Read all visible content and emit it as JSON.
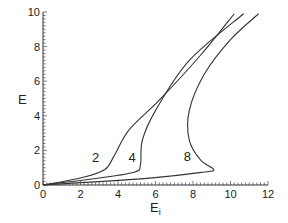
{
  "chart_data": {
    "type": "line",
    "title": "",
    "xlabel": "E",
    "xlabel_sub": "i",
    "ylabel": "E",
    "xlim": [
      0,
      12
    ],
    "ylim": [
      0,
      10
    ],
    "x_ticks": [
      "0",
      "2",
      "4",
      "6",
      "8",
      "10",
      "12"
    ],
    "y_ticks": [
      "0",
      "2",
      "4",
      "6",
      "8",
      "10"
    ],
    "grid": false,
    "legend": "none",
    "series": [
      {
        "name": "2",
        "points": [
          [
            0,
            0
          ],
          [
            2.0,
            0.4
          ],
          [
            3.3,
            0.9
          ],
          [
            3.8,
            1.7
          ],
          [
            4.6,
            3.2
          ],
          [
            6.2,
            4.9
          ],
          [
            8.4,
            7.5
          ],
          [
            10.2,
            9.9
          ]
        ]
      },
      {
        "name": "4",
        "points": [
          [
            0,
            0
          ],
          [
            3.0,
            0.4
          ],
          [
            4.9,
            0.75
          ],
          [
            5.2,
            1.2
          ],
          [
            5.3,
            2.6
          ],
          [
            6.0,
            4.3
          ],
          [
            7.8,
            7.2
          ],
          [
            10.7,
            9.9
          ]
        ]
      },
      {
        "name": "8",
        "points": [
          [
            0,
            0
          ],
          [
            5.7,
            0.4
          ],
          [
            8.6,
            0.75
          ],
          [
            9.1,
            0.9
          ],
          [
            8.4,
            1.45
          ],
          [
            7.8,
            2.6
          ],
          [
            7.8,
            4.3
          ],
          [
            8.6,
            6.4
          ],
          [
            10.0,
            8.4
          ],
          [
            11.5,
            9.9
          ]
        ]
      }
    ],
    "annotations": [
      {
        "text": "2",
        "x": 2.8,
        "y": 1.6
      },
      {
        "text": "4",
        "x": 4.75,
        "y": 1.6
      },
      {
        "text": "8",
        "x": 7.7,
        "y": 1.7
      }
    ]
  }
}
